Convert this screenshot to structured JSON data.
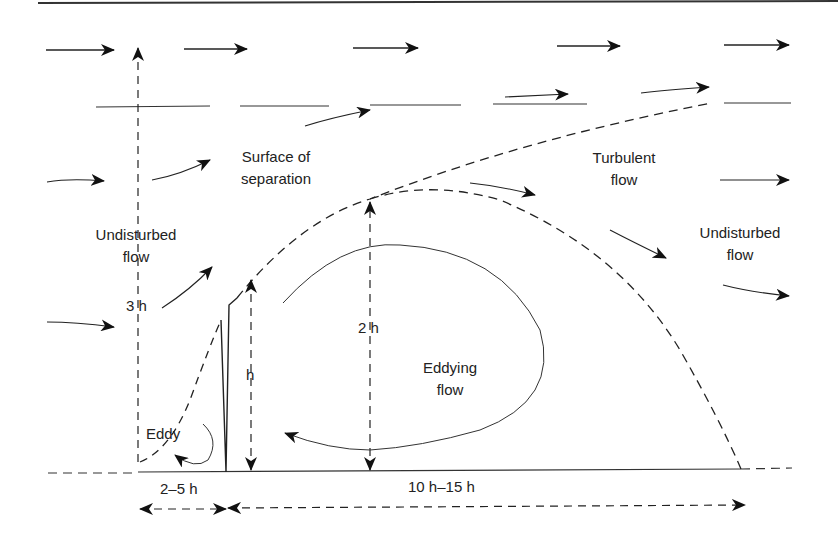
{
  "diagram": {
    "stroke_color": "#222222",
    "labels": {
      "surface_of_separation": [
        "Surface of",
        "separation"
      ],
      "turbulent_flow": [
        "Turbulent",
        "flow"
      ],
      "undisturbed_flow_left": [
        "Undisturbed",
        "flow"
      ],
      "undisturbed_flow_right": [
        "Undisturbed",
        "flow"
      ],
      "eddying_flow": [
        "Eddying",
        "flow"
      ],
      "eddy": "Eddy"
    },
    "dimensions": {
      "upwind_height": "3 h",
      "barrier_height": "h",
      "eddy_height": "2 h",
      "upwind_distance": "2–5 h",
      "downwind_distance": "10 h–15 h"
    }
  }
}
